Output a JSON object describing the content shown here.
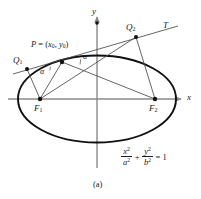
{
  "figure": {
    "caption": "(a)",
    "axes": {
      "x_label": "x",
      "y_label": "y"
    },
    "points": [
      {
        "id": "P",
        "label": "P = (x₀, y₀)",
        "name": "P",
        "x": 62,
        "y": 62
      },
      {
        "id": "Q1",
        "label": "Q",
        "sub": "1",
        "x": 27,
        "y": 69
      },
      {
        "id": "Q2",
        "label": "Q",
        "sub": "2",
        "x": 136,
        "y": 37
      },
      {
        "id": "F1",
        "label": "F",
        "sub": "1",
        "x": 40,
        "y": 99
      },
      {
        "id": "F2",
        "label": "F",
        "sub": "2",
        "x": 155,
        "y": 99
      }
    ],
    "tangent_label": "T",
    "angle_labels": [
      {
        "id": "alpha-left",
        "text": "α"
      },
      {
        "id": "alpha-right",
        "text": "α"
      }
    ],
    "p_label": {
      "name": "P",
      "equals": " = (",
      "x0": "x",
      "x0_sub": "0",
      "comma": ", ",
      "y0": "y",
      "y0_sub": "0",
      "close": ")"
    },
    "equation": {
      "num1": "x",
      "num1_sup": "2",
      "den1": "a",
      "den1_sup": "2",
      "plus": "+",
      "num2": "y",
      "num2_sup": "2",
      "den2": "b",
      "den2_sup": "2",
      "equals": "= 1"
    },
    "colors": {
      "ink": "#1a1a1a",
      "curve": "#000000",
      "axis": "#888888",
      "thin": "#555555",
      "background": "#ffffff"
    }
  }
}
